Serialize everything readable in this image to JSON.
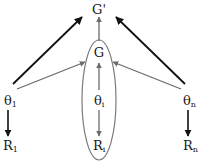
{
  "diagram": {
    "top_node": {
      "label": "G'"
    },
    "group_node": {
      "label": "G"
    },
    "param_nodes": [
      {
        "base": "θ",
        "sub": "1"
      },
      {
        "base": "θ",
        "sub": "i"
      },
      {
        "base": "θ",
        "sub": "n"
      }
    ],
    "result_nodes": [
      {
        "base": "R",
        "sub": "1"
      },
      {
        "base": "R",
        "sub": "i"
      },
      {
        "base": "R",
        "sub": "n"
      }
    ],
    "colors": {
      "dark_arrow": "#111111",
      "gray_arrow": "#6b6b6b",
      "ellipse": "#7a7a7a"
    },
    "edges": [
      {
        "from": "θ1",
        "to": "G'",
        "style": "dark"
      },
      {
        "from": "θn",
        "to": "G'",
        "style": "dark"
      },
      {
        "from": "θ1",
        "to": "G",
        "style": "gray"
      },
      {
        "from": "θn",
        "to": "G",
        "style": "gray"
      },
      {
        "from": "θi",
        "to": "G",
        "style": "gray"
      },
      {
        "from": "G",
        "to": "G'",
        "style": "gray"
      },
      {
        "from": "θ1",
        "to": "R1",
        "style": "dark"
      },
      {
        "from": "θi",
        "to": "Ri",
        "style": "gray"
      },
      {
        "from": "θn",
        "to": "Rn",
        "style": "dark"
      }
    ]
  }
}
